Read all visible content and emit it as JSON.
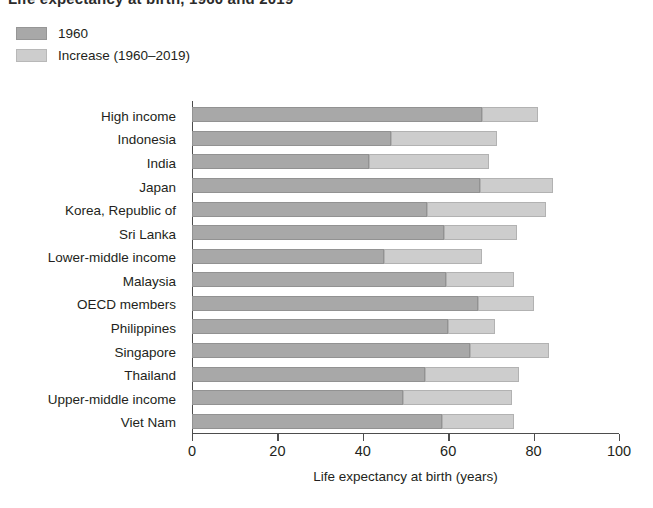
{
  "title": {
    "text": "Life expectancy at birth, 1960 and 2019"
  },
  "legend": {
    "items": [
      {
        "label": "1960",
        "color": "#a8a8a8",
        "swatch_name": "legend-swatch-1960"
      },
      {
        "label": "Increase (1960–2019)",
        "color": "#cdcdcd",
        "swatch_name": "legend-swatch-increase"
      }
    ]
  },
  "axis": {
    "x_title": "Life expectancy at birth (years)",
    "x_ticks": [
      0,
      20,
      40,
      60,
      80,
      100
    ],
    "x_tick_labels": [
      "0",
      "20",
      "40",
      "60",
      "80",
      "100"
    ]
  },
  "chart_data": {
    "type": "bar",
    "orientation": "horizontal",
    "stacked": true,
    "title": "Life expectancy at birth, 1960 and 2019",
    "xlabel": "Life expectancy at birth (years)",
    "ylabel": "",
    "xlim": [
      0,
      100
    ],
    "grid": false,
    "legend_position": "top-left",
    "categories": [
      "High income",
      "Indonesia",
      "India",
      "Japan",
      "Korea, Republic of",
      "Sri Lanka",
      "Lower-middle income",
      "Malaysia",
      "OECD members",
      "Philippines",
      "Singapore",
      "Thailand",
      "Upper-middle income",
      "Viet Nam"
    ],
    "series": [
      {
        "name": "1960",
        "color": "#a8a8a8",
        "values": [
          68,
          46.5,
          41.5,
          67.5,
          55,
          59,
          45,
          59.5,
          67,
          60,
          65,
          54.5,
          49.5,
          58.5
        ]
      },
      {
        "name": "Increase (1960–2019)",
        "color": "#cdcdcd",
        "values": [
          13,
          25,
          28,
          17,
          28,
          17,
          23,
          16,
          13,
          11,
          18.5,
          22,
          25.5,
          17
        ]
      }
    ],
    "totals": [
      81,
      71.5,
      69.5,
      84.5,
      83,
      76,
      68,
      75.5,
      80,
      71,
      83.5,
      76.5,
      75,
      75.5
    ]
  }
}
